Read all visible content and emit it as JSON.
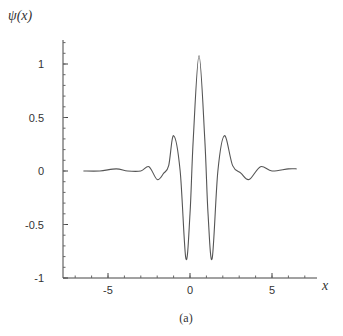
{
  "chart_data": {
    "type": "line",
    "title": "",
    "caption": "(a)",
    "xlabel": "x",
    "ylabel": "ψ(x)",
    "xlim": [
      -7.5,
      7.8
    ],
    "ylim": [
      -1,
      1.3
    ],
    "xticks": [
      -5,
      0,
      5
    ],
    "xtick_labels": [
      "-5",
      "0",
      "5"
    ],
    "yticks": [
      1,
      0.5,
      0,
      -0.5,
      -1
    ],
    "ytick_labels": [
      "1",
      "0.5",
      "0",
      "-0.5",
      "-1"
    ],
    "grid": false,
    "legend": null,
    "series": [
      {
        "name": "ψ(x)",
        "color": "#555555",
        "x": [
          -6.5,
          -5.5,
          -4.5,
          -3.8,
          -3.0,
          -2.5,
          -2.0,
          -1.6,
          -1.3,
          -1.0,
          -0.6,
          -0.25,
          0.0,
          0.2,
          0.55,
          0.9,
          1.1,
          1.35,
          1.7,
          2.1,
          2.6,
          3.1,
          3.6,
          4.3,
          5.0,
          6.0,
          6.5
        ],
        "values": [
          0.0,
          0.0,
          0.02,
          0.0,
          0.0,
          0.04,
          -0.08,
          -0.02,
          0.05,
          0.33,
          0.0,
          -0.82,
          -0.4,
          0.3,
          1.08,
          0.3,
          -0.4,
          -0.82,
          0.0,
          0.33,
          0.05,
          -0.02,
          -0.08,
          0.04,
          0.0,
          0.02,
          0.02
        ]
      }
    ]
  }
}
